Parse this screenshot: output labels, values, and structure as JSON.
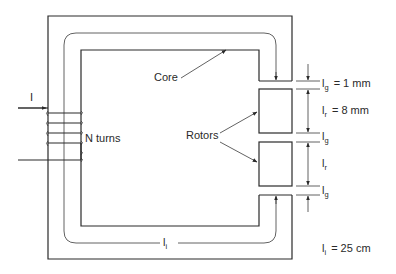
{
  "diagram": {
    "type": "magnetic-circuit",
    "labels": {
      "current": "I",
      "coil": "N turns",
      "core": "Core",
      "rotors": "Rotors",
      "path_length": "l",
      "path_length_sub": "i"
    },
    "dimensions": [
      {
        "symbol": "l",
        "sub": "g",
        "value": "= 1 mm"
      },
      {
        "symbol": "l",
        "sub": "r",
        "value": "= 8 mm"
      },
      {
        "symbol": "l",
        "sub": "g",
        "value": ""
      },
      {
        "symbol": "l",
        "sub": "r",
        "value": ""
      },
      {
        "symbol": "l",
        "sub": "g",
        "value": ""
      }
    ],
    "core_length": {
      "symbol": "l",
      "sub": "i",
      "value": "= 25 cm"
    },
    "colors": {
      "line": "#2a2a2a",
      "background": "#ffffff"
    }
  }
}
